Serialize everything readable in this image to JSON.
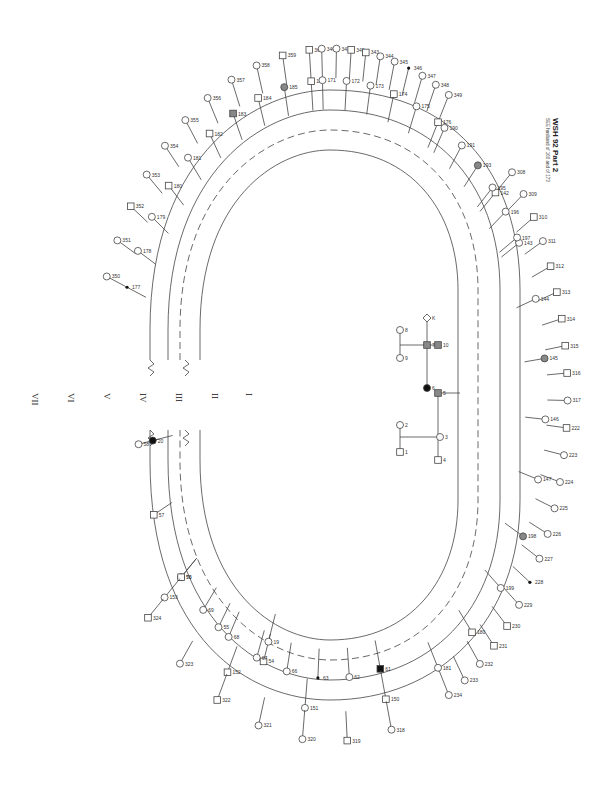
{
  "title": "WSH 92  Part 2",
  "subtitle": "SEE husband of 160 and of 173",
  "generations": [
    "VII",
    "VI",
    "V",
    "IV",
    "III",
    "II",
    "I"
  ],
  "colors": {
    "line": "#444444",
    "affected": "#111111",
    "carrier": "#888888"
  },
  "individuals": [
    {
      "id": "350",
      "sex": "F",
      "status": "normal",
      "gen": "VII",
      "side": "left"
    },
    {
      "id": "351",
      "sex": "F",
      "status": "normal",
      "gen": "VII",
      "side": "left"
    },
    {
      "id": "352",
      "sex": "M",
      "status": "normal",
      "gen": "VII",
      "side": "left"
    },
    {
      "id": "353",
      "sex": "F",
      "status": "normal",
      "gen": "VII",
      "side": "left"
    },
    {
      "id": "354",
      "sex": "F",
      "status": "normal",
      "gen": "VII",
      "side": "left"
    },
    {
      "id": "355",
      "sex": "F",
      "status": "normal",
      "gen": "VII",
      "side": "left"
    },
    {
      "id": "356",
      "sex": "F",
      "status": "normal",
      "gen": "VII",
      "side": "left"
    },
    {
      "id": "357",
      "sex": "F",
      "status": "normal",
      "gen": "VII",
      "side": "left"
    },
    {
      "id": "358",
      "sex": "F",
      "status": "normal",
      "gen": "VII",
      "side": "left"
    },
    {
      "id": "359",
      "sex": "M",
      "status": "normal",
      "gen": "VII",
      "side": "left"
    },
    {
      "id": "360",
      "sex": "M",
      "status": "normal",
      "gen": "VII",
      "side": "left"
    },
    {
      "id": "177",
      "sex": "U",
      "status": "deceased",
      "gen": "VI",
      "side": "left"
    },
    {
      "id": "178",
      "sex": "F",
      "status": "normal",
      "gen": "VI",
      "side": "left"
    },
    {
      "id": "179",
      "sex": "F",
      "status": "normal",
      "gen": "VI",
      "side": "left"
    },
    {
      "id": "180",
      "sex": "M",
      "status": "normal",
      "gen": "VI",
      "side": "left"
    },
    {
      "id": "181",
      "sex": "F",
      "status": "normal",
      "gen": "VI",
      "side": "left"
    },
    {
      "id": "182",
      "sex": "M",
      "status": "normal",
      "gen": "VI",
      "side": "left"
    },
    {
      "id": "183",
      "sex": "M",
      "status": "carrier",
      "gen": "VI",
      "side": "left"
    },
    {
      "id": "184",
      "sex": "M",
      "status": "normal",
      "gen": "VI",
      "side": "left"
    },
    {
      "id": "185",
      "sex": "F",
      "status": "carrier",
      "gen": "VI",
      "side": "left"
    },
    {
      "id": "186",
      "sex": "M",
      "status": "normal",
      "gen": "VI",
      "side": "left"
    },
    {
      "id": "308",
      "sex": "F",
      "status": "normal",
      "gen": "VII",
      "side": "right"
    },
    {
      "id": "309",
      "sex": "F",
      "status": "normal",
      "gen": "VII",
      "side": "right"
    },
    {
      "id": "310",
      "sex": "M",
      "status": "normal",
      "gen": "VII",
      "side": "right"
    },
    {
      "id": "311",
      "sex": "F",
      "status": "normal",
      "gen": "VII",
      "side": "right"
    },
    {
      "id": "312",
      "sex": "M",
      "status": "normal",
      "gen": "VII",
      "side": "right"
    },
    {
      "id": "313",
      "sex": "M",
      "status": "normal",
      "gen": "VII",
      "side": "right"
    },
    {
      "id": "314",
      "sex": "M",
      "status": "normal",
      "gen": "VII",
      "side": "right"
    },
    {
      "id": "315",
      "sex": "M",
      "status": "normal",
      "gen": "VII",
      "side": "right"
    },
    {
      "id": "316",
      "sex": "M",
      "status": "normal",
      "gen": "VII",
      "side": "right"
    },
    {
      "id": "317",
      "sex": "F",
      "status": "normal",
      "gen": "VII",
      "side": "right"
    },
    {
      "id": "142",
      "sex": "M",
      "status": "normal",
      "gen": "VI",
      "side": "right"
    },
    {
      "id": "143",
      "sex": "F",
      "status": "normal",
      "gen": "VI",
      "side": "right"
    },
    {
      "id": "144",
      "sex": "F",
      "status": "normal",
      "gen": "VI",
      "side": "right"
    },
    {
      "id": "145",
      "sex": "F",
      "status": "carrier",
      "gen": "VI",
      "side": "right"
    },
    {
      "id": "146",
      "sex": "F",
      "status": "normal",
      "gen": "VI",
      "side": "right"
    },
    {
      "id": "147",
      "sex": "F",
      "status": "normal",
      "gen": "VI",
      "side": "right"
    },
    {
      "id": "54",
      "sex": "M",
      "status": "normal",
      "gen": "V",
      "side": "right"
    },
    {
      "id": "55",
      "sex": "F",
      "status": "normal",
      "gen": "V",
      "side": "right"
    },
    {
      "id": "56",
      "sex": "F",
      "status": "carrier",
      "gen": "V",
      "side": "right"
    },
    {
      "id": "57",
      "sex": "M",
      "status": "normal",
      "gen": "V",
      "side": "right"
    },
    {
      "id": "58",
      "sex": "F",
      "status": "normal",
      "gen": "V",
      "side": "right"
    },
    {
      "id": "19",
      "sex": "F",
      "status": "normal",
      "gen": "IV",
      "side": "right"
    },
    {
      "id": "20",
      "sex": "F",
      "status": "affected",
      "gen": "IV",
      "side": "right"
    },
    {
      "id": "61",
      "sex": "M",
      "status": "affected",
      "gen": "V",
      "side": "bottom"
    },
    {
      "id": "62",
      "sex": "F",
      "status": "normal",
      "gen": "V",
      "side": "bottom"
    },
    {
      "id": "63",
      "sex": "U",
      "status": "deceased",
      "gen": "V",
      "side": "bottom"
    },
    {
      "id": "150",
      "sex": "M",
      "status": "normal",
      "gen": "VI",
      "side": "bottom"
    },
    {
      "id": "151",
      "sex": "F",
      "status": "normal",
      "gen": "VI",
      "side": "bottom"
    },
    {
      "id": "318",
      "sex": "F",
      "status": "normal",
      "gen": "VII",
      "side": "bottom"
    },
    {
      "id": "319",
      "sex": "M",
      "status": "normal",
      "gen": "VII",
      "side": "bottom"
    },
    {
      "id": "320",
      "sex": "F",
      "status": "normal",
      "gen": "VII",
      "side": "bottom"
    },
    {
      "id": "321",
      "sex": "F",
      "status": "normal",
      "gen": "VII",
      "side": "bottom"
    },
    {
      "id": "152",
      "sex": "M",
      "status": "normal",
      "gen": "VI",
      "side": "bottom"
    },
    {
      "id": "153",
      "sex": "F",
      "status": "normal",
      "gen": "VI",
      "side": "bottom"
    },
    {
      "id": "322",
      "sex": "M",
      "status": "normal",
      "gen": "VII",
      "side": "bottom"
    },
    {
      "id": "323",
      "sex": "F",
      "status": "normal",
      "gen": "VII",
      "side": "bottom"
    },
    {
      "id": "324",
      "sex": "M",
      "status": "normal",
      "gen": "VII",
      "side": "bottom"
    },
    {
      "id": "66",
      "sex": "F",
      "status": "normal",
      "gen": "V",
      "side": "bottom"
    },
    {
      "id": "67",
      "sex": "F",
      "status": "normal",
      "gen": "V",
      "side": "bottom"
    },
    {
      "id": "68",
      "sex": "F",
      "status": "normal",
      "gen": "V",
      "side": "bottom"
    },
    {
      "id": "69",
      "sex": "F",
      "status": "normal",
      "gen": "V",
      "side": "bottom"
    },
    {
      "id": "70",
      "sex": "M",
      "status": "normal",
      "gen": "V",
      "side": "bottom"
    },
    {
      "id": "190",
      "sex": "F",
      "status": "normal",
      "gen": "VI",
      "side": "top-right"
    },
    {
      "id": "191",
      "sex": "F",
      "status": "normal",
      "gen": "VI",
      "side": "top-right"
    },
    {
      "id": "193",
      "sex": "F",
      "status": "carrier",
      "gen": "VI",
      "side": "top-right"
    },
    {
      "id": "195",
      "sex": "F",
      "status": "normal",
      "gen": "VI",
      "side": "top-right"
    },
    {
      "id": "196",
      "sex": "F",
      "status": "normal",
      "gen": "VI",
      "side": "top-right"
    },
    {
      "id": "197",
      "sex": "F",
      "status": "normal",
      "gen": "VI",
      "side": "top-right"
    },
    {
      "id": "198",
      "sex": "F",
      "status": "carrier",
      "gen": "VI",
      "side": "right"
    },
    {
      "id": "199",
      "sex": "F",
      "status": "normal",
      "gen": "VI",
      "side": "right"
    },
    {
      "id": "222",
      "sex": "M",
      "status": "normal",
      "gen": "VII",
      "side": "right"
    },
    {
      "id": "223",
      "sex": "F",
      "status": "normal",
      "gen": "VII",
      "side": "right"
    },
    {
      "id": "224",
      "sex": "F",
      "status": "normal",
      "gen": "VII",
      "side": "right"
    },
    {
      "id": "225",
      "sex": "F",
      "status": "normal",
      "gen": "VII",
      "side": "right"
    },
    {
      "id": "226",
      "sex": "F",
      "status": "normal",
      "gen": "VII",
      "side": "right"
    },
    {
      "id": "227",
      "sex": "F",
      "status": "normal",
      "gen": "VII",
      "side": "right"
    },
    {
      "id": "228",
      "sex": "U",
      "status": "deceased",
      "gen": "VII",
      "side": "right"
    },
    {
      "id": "229",
      "sex": "F",
      "status": "normal",
      "gen": "VII",
      "side": "right"
    },
    {
      "id": "230",
      "sex": "M",
      "status": "normal",
      "gen": "VII",
      "side": "right"
    },
    {
      "id": "231",
      "sex": "M",
      "status": "normal",
      "gen": "VII",
      "side": "right"
    },
    {
      "id": "232",
      "sex": "F",
      "status": "normal",
      "gen": "VII",
      "side": "right"
    },
    {
      "id": "233",
      "sex": "F",
      "status": "normal",
      "gen": "VII",
      "side": "right"
    },
    {
      "id": "234",
      "sex": "F",
      "status": "normal",
      "gen": "VII",
      "side": "right"
    },
    {
      "id": "180b",
      "label": "180",
      "sex": "M",
      "status": "normal",
      "gen": "VI",
      "side": "right"
    },
    {
      "id": "181b",
      "label": "181",
      "sex": "F",
      "status": "normal",
      "gen": "VI",
      "side": "right"
    },
    {
      "id": "340",
      "sex": "F",
      "status": "normal",
      "gen": "VII",
      "side": "top"
    },
    {
      "id": "341",
      "sex": "F",
      "status": "normal",
      "gen": "VII",
      "side": "top"
    },
    {
      "id": "342",
      "sex": "M",
      "status": "normal",
      "gen": "VII",
      "side": "top"
    },
    {
      "id": "343",
      "sex": "M",
      "status": "normal",
      "gen": "VII",
      "side": "top"
    },
    {
      "id": "344",
      "sex": "F",
      "status": "normal",
      "gen": "VII",
      "side": "top"
    },
    {
      "id": "345",
      "sex": "F",
      "status": "normal",
      "gen": "VII",
      "side": "top"
    },
    {
      "id": "346",
      "sex": "U",
      "status": "deceased",
      "gen": "VII",
      "side": "top"
    },
    {
      "id": "347",
      "sex": "F",
      "status": "normal",
      "gen": "VII",
      "side": "top"
    },
    {
      "id": "171",
      "sex": "F",
      "status": "normal",
      "gen": "VI",
      "side": "top"
    },
    {
      "id": "172",
      "sex": "F",
      "status": "normal",
      "gen": "VI",
      "side": "top"
    },
    {
      "id": "173",
      "sex": "F",
      "status": "normal",
      "gen": "VI",
      "side": "top"
    },
    {
      "id": "174",
      "sex": "M",
      "status": "normal",
      "gen": "VI",
      "side": "top"
    },
    {
      "id": "175",
      "sex": "F",
      "status": "normal",
      "gen": "VI",
      "side": "top"
    },
    {
      "id": "176",
      "sex": "M",
      "status": "normal",
      "gen": "VI",
      "side": "top"
    },
    {
      "id": "348",
      "sex": "F",
      "status": "normal",
      "gen": "VII",
      "side": "top"
    },
    {
      "id": "349",
      "sex": "F",
      "status": "normal",
      "gen": "VII",
      "side": "top"
    }
  ],
  "center": [
    {
      "id": "1",
      "label": "1",
      "sex": "M",
      "status": "normal",
      "gen": "I"
    },
    {
      "id": "2",
      "label": "2",
      "sex": "F",
      "status": "normal",
      "gen": "I"
    },
    {
      "id": "3",
      "label": "3",
      "sex": "F",
      "status": "normal",
      "gen": "II"
    },
    {
      "id": "4",
      "label": "4",
      "sex": "M",
      "status": "normal",
      "gen": "II"
    },
    {
      "id": "5",
      "label": "5",
      "sex": "M",
      "status": "carrier",
      "gen": "III"
    },
    {
      "id": "6",
      "label": "6",
      "sex": "F",
      "status": "affected",
      "gen": "III"
    },
    {
      "id": "7",
      "label": "7",
      "sex": "M",
      "status": "carrier",
      "gen": "III"
    },
    {
      "id": "8",
      "label": "8",
      "sex": "F",
      "status": "normal",
      "gen": "II"
    },
    {
      "id": "9",
      "label": "9",
      "sex": "F",
      "status": "normal",
      "gen": "II"
    },
    {
      "id": "10",
      "label": "10",
      "sex": "M",
      "status": "carrier",
      "gen": "II"
    },
    {
      "id": "11",
      "label": "K",
      "sex": "U",
      "status": "normal",
      "gen": "III"
    }
  ]
}
